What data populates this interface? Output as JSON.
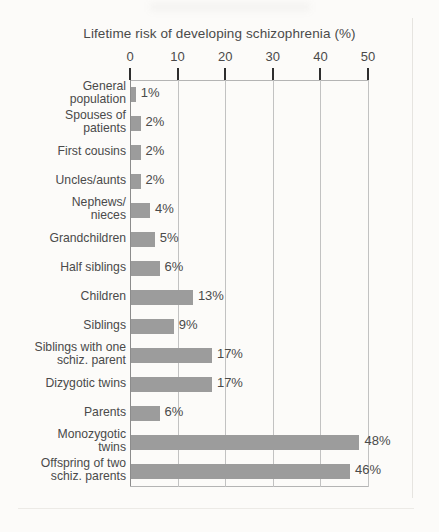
{
  "chart_data": {
    "type": "bar",
    "orientation": "horizontal",
    "title": "Lifetime risk of  developing schizophrenia (%)",
    "xlabel": "",
    "ylabel": "",
    "xlim": [
      0,
      50
    ],
    "xticks": [
      0,
      10,
      20,
      30,
      40,
      50
    ],
    "xtick_labels": [
      "0",
      "10",
      "20",
      "30",
      "40",
      "50"
    ],
    "grid": "vertical",
    "legend": "none",
    "bar_color": "#9c9c9c",
    "categories": [
      "General\npopulation",
      "Spouses of\npatients",
      "First cousins",
      "Uncles/aunts",
      "Nephews/\nnieces",
      "Grandchildren",
      "Half siblings",
      "Children",
      "Siblings",
      "Siblings with one\nschiz. parent",
      "Dizygotic twins",
      "Parents",
      "Monozygotic\ntwins",
      "Offspring of two\nschiz. parents"
    ],
    "values": [
      1,
      2,
      2,
      2,
      4,
      5,
      6,
      13,
      9,
      17,
      17,
      6,
      48,
      46
    ],
    "value_labels": [
      "1%",
      "2%",
      "2%",
      "2%",
      "4%",
      "5%",
      "6%",
      "13%",
      "9%",
      "17%",
      "17%",
      "6%",
      "48%",
      "46%"
    ]
  }
}
